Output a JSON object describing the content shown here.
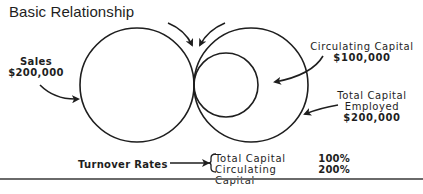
{
  "title": "Basic Relationship",
  "diagram": {
    "sales": {
      "label": "Sales",
      "value": "$200,000"
    },
    "circulating_capital": {
      "label": "Circulating Capital",
      "value": "$100,000"
    },
    "total_capital_employed": {
      "label_line1": "Total Capital",
      "label_line2": "Employed",
      "value": "$200,000"
    }
  },
  "turnover": {
    "label": "Turnover Rates",
    "rows": [
      {
        "name": "Total Capital",
        "rate": "100%"
      },
      {
        "name": "Circulating Capital",
        "rate": "200%"
      }
    ]
  },
  "colors": {
    "ink": "#1e1e1e",
    "rule": "#6a6a6a",
    "background": "#ffffff"
  }
}
